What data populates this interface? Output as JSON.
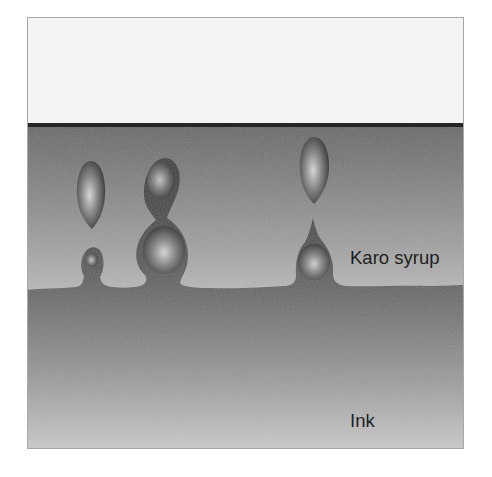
{
  "diagram": {
    "type": "cross-section illustration",
    "layers": [
      {
        "name": "air",
        "label": "",
        "color_top": "#f4f4f4",
        "color_bottom": "#f4f4f4"
      },
      {
        "name": "syrup",
        "label": "Karo syrup",
        "color_top": "#676767",
        "color_bottom": "#b8b8b8"
      },
      {
        "name": "ink",
        "label": "Ink",
        "color_top": "#363636",
        "color_bottom": "#cacaca"
      }
    ],
    "labels": {
      "syrup": "Karo syrup",
      "ink": "Ink"
    },
    "colors": {
      "interface_line": "#262626",
      "frame_border": "#9a9a9a",
      "drop_highlight": "#d8d8d8",
      "drop_dark": "#3a3a3a"
    },
    "droplets": [
      {
        "name": "drop-group-left",
        "parts": [
          "floating teardrop",
          "small bump"
        ]
      },
      {
        "name": "drop-group-middle",
        "parts": [
          "upper blob",
          "lower blob",
          "stem"
        ]
      },
      {
        "name": "drop-group-right",
        "parts": [
          "floating teardrop",
          "cone with bulb"
        ]
      }
    ]
  }
}
